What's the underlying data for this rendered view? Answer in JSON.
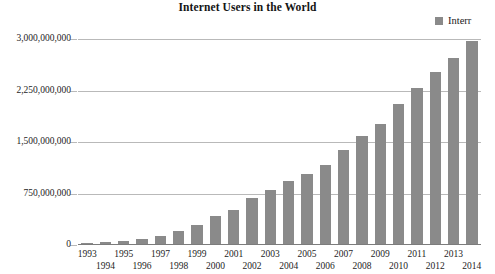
{
  "chart_data": {
    "type": "bar",
    "title": "Internet Users in the World",
    "xlabel": "",
    "ylabel": "",
    "legend": [
      {
        "label": "Interr",
        "color": "#8a8a8a",
        "marker": "square"
      }
    ],
    "legend_position": "top-right",
    "legend_note": "Legend text clipped at right edge of image",
    "grid": true,
    "ylim": [
      0,
      3000000000
    ],
    "yticks": [
      0,
      750000000,
      1500000000,
      2250000000,
      3000000000
    ],
    "ytick_labels": [
      "0",
      "750,000,000",
      "1,500,000,000",
      "2,250,000,000",
      "3,000,000,000"
    ],
    "categories": [
      "1993",
      "1994",
      "1995",
      "1996",
      "1997",
      "1998",
      "1999",
      "2000",
      "2001",
      "2002",
      "2003",
      "2004",
      "2005",
      "2006",
      "2007",
      "2008",
      "2009",
      "2010",
      "2011",
      "2012",
      "2013",
      "2014"
    ],
    "values": [
      14000000,
      25000000,
      45000000,
      77000000,
      120000000,
      188000000,
      281000000,
      414000000,
      502000000,
      665000000,
      781000000,
      913000000,
      1024000000,
      1151000000,
      1365000000,
      1572000000,
      1752000000,
      2034000000,
      2272000000,
      2511000000,
      2712000000,
      2956000000
    ],
    "series": [
      {
        "name": "Interr",
        "values": [
          14000000,
          25000000,
          45000000,
          77000000,
          120000000,
          188000000,
          281000000,
          414000000,
          502000000,
          665000000,
          781000000,
          913000000,
          1024000000,
          1151000000,
          1365000000,
          1572000000,
          1752000000,
          2034000000,
          2272000000,
          2511000000,
          2712000000,
          2956000000
        ]
      }
    ],
    "bar_color": "#8a8a8a",
    "gridline_color": "#b9b9b9",
    "axis_color": "#7c7c7c",
    "background": "#ffffff"
  }
}
